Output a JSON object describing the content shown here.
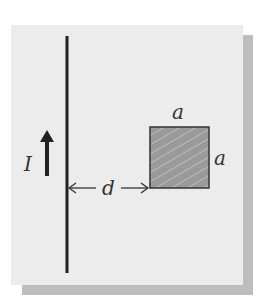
{
  "diagram": {
    "labels": {
      "current": "I",
      "distance": "d",
      "side_top": "a",
      "side_right": "a"
    },
    "colors": {
      "background": "#ececec",
      "shadow": "#bdbdbd",
      "wire": "#222222",
      "loop_fill": "#9a9a9a",
      "loop_border": "#333333"
    }
  }
}
